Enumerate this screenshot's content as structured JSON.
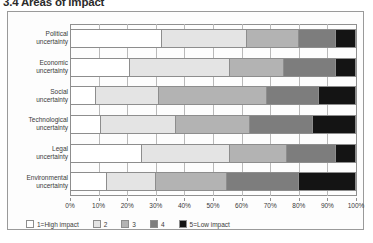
{
  "figure": {
    "title": "3.4 Areas of impact"
  },
  "chart_data": {
    "type": "bar",
    "orientation": "horizontal",
    "stacked": true,
    "normalized": true,
    "title": "3.4 Areas of impact",
    "xlabel": "",
    "ylabel": "",
    "xlim": [
      0,
      100
    ],
    "grid": true,
    "legend_position": "bottom-left",
    "categories": [
      "Political uncertainty",
      "Economic uncertainty",
      "Social uncertainty",
      "Technological uncertainty",
      "Legal uncertainty",
      "Environmental uncertainty"
    ],
    "x_tick_labels": [
      "0%",
      "10%",
      "20%",
      "30%",
      "40%",
      "50%",
      "60%",
      "70%",
      "80%",
      "90%",
      "100%"
    ],
    "x_tick_values": [
      0,
      10,
      20,
      30,
      40,
      50,
      60,
      70,
      80,
      90,
      100
    ],
    "series": [
      {
        "name": "1=High impact",
        "color": "#ffffff",
        "values": [
          32,
          21,
          9,
          11,
          25,
          13
        ]
      },
      {
        "name": "2",
        "color": "#e4e4e4",
        "values": [
          30,
          35,
          22,
          26,
          31,
          17
        ]
      },
      {
        "name": "3",
        "color": "#b3b3b3",
        "values": [
          18,
          19,
          38,
          26,
          20,
          25
        ]
      },
      {
        "name": "4",
        "color": "#7d7d7d",
        "values": [
          13,
          18,
          18,
          22,
          17,
          25
        ]
      },
      {
        "name": "5=Low impact",
        "color": "#141414",
        "values": [
          7,
          7,
          13,
          15,
          7,
          20
        ]
      }
    ]
  },
  "legend": {
    "items": [
      {
        "label": "1=High impact",
        "color": "#ffffff"
      },
      {
        "label": "2",
        "color": "#e4e4e4"
      },
      {
        "label": "3",
        "color": "#b3b3b3"
      },
      {
        "label": "4",
        "color": "#7d7d7d"
      },
      {
        "label": "5=Low impact",
        "color": "#141414"
      }
    ]
  }
}
